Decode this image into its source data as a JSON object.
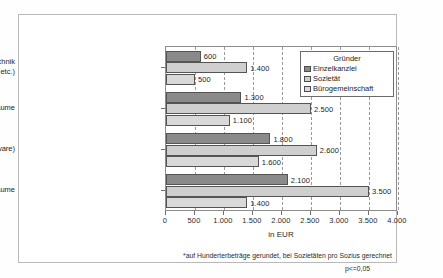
{
  "chart_data": {
    "type": "bar",
    "orientation": "horizontal",
    "title": "",
    "xlabel": "in EUR",
    "ylabel": "",
    "xlim": [
      0,
      4000
    ],
    "xticks": [
      0,
      500,
      1000,
      1500,
      2000,
      2500,
      3000,
      3500,
      4000
    ],
    "xtick_labels": [
      "0",
      "500",
      "1.000",
      "1.500",
      "2.000",
      "2.500",
      "3.000",
      "3.500",
      "4.000"
    ],
    "grid": true,
    "legend_position": "top-right",
    "legend_title": "Gründer",
    "categories": [
      "sonst. Bürotechnik (Telefon, Kopiergerät etc.)",
      "Renovierung Büroräume",
      "EDV-Anlage (Hard- / Software)",
      "Einrichtung Büroräume"
    ],
    "category_lines": [
      [
        "sonst. Bürotechnik",
        "(Telefon, Kopiergerät etc.)"
      ],
      [
        "Renovierung Büroräume"
      ],
      [
        "EDV-Anlage (Hard- / Software)"
      ],
      [
        "Einrichtung Büroräume"
      ]
    ],
    "series": [
      {
        "name": "Einzelkanzlei",
        "color": "#8a8a8a",
        "values": [
          600,
          1300,
          1800,
          2100
        ],
        "labels": [
          "600",
          "1.300",
          "1.800",
          "2.100"
        ]
      },
      {
        "name": "Sozietät",
        "color": "#cfcfcf",
        "values": [
          1400,
          2500,
          2600,
          3500
        ],
        "labels": [
          "1.400",
          "2.500",
          "2.600",
          "3.500"
        ]
      },
      {
        "name": "Bürogemeinschaft",
        "color": "#d9d9d9",
        "values": [
          500,
          1100,
          1600,
          1400
        ],
        "labels": [
          "500",
          "1.100",
          "1.600",
          "1.400"
        ]
      }
    ],
    "footnote": "*auf Hunderterbeträge gerundet, bei Sozietäten pro Sozius gerechnet",
    "significance": "p<=0,05"
  }
}
